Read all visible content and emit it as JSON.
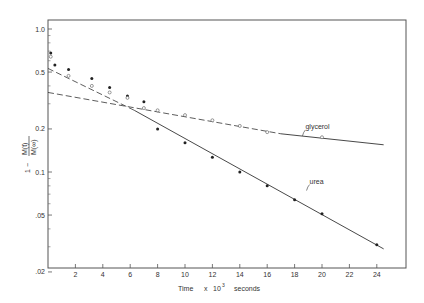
{
  "chart_data": {
    "type": "line",
    "title": "",
    "xlabel": "Time x 10^3 seconds",
    "xlabel_parts": {
      "main": "Time",
      "mult": "x",
      "base": "10",
      "exp": "3",
      "unit": "seconds"
    },
    "ylabel": "1 - M(t)/M(∞)",
    "ylabel_parts": {
      "prefix": "1 −",
      "num": "M(t)",
      "den": "M(∞)"
    },
    "xlim": [
      0,
      26
    ],
    "ylim": [
      0.02,
      1.1
    ],
    "yscale": "log",
    "grid": false,
    "x_ticks": [
      2,
      4,
      6,
      8,
      10,
      12,
      14,
      16,
      18,
      20,
      22,
      24
    ],
    "x_tick_labels": [
      "2",
      "4",
      "6",
      "8",
      "10",
      "12",
      "14",
      "16",
      "18",
      "20",
      "22",
      "24"
    ],
    "y_ticks": [
      1.0,
      0.5,
      0.2,
      0.1,
      0.05,
      0.02
    ],
    "y_tick_labels": [
      "1.0",
      "0.5",
      "0.2",
      "0.1",
      ".05",
      ".02"
    ],
    "series": [
      {
        "name": "urea",
        "marker": "filled",
        "points": [
          [
            0.2,
            0.68
          ],
          [
            0.5,
            0.56
          ],
          [
            1.5,
            0.52
          ],
          [
            3.2,
            0.45
          ],
          [
            4.5,
            0.39
          ],
          [
            5.8,
            0.34
          ],
          [
            7.0,
            0.31
          ],
          [
            8,
            0.2
          ],
          [
            10,
            0.16
          ],
          [
            12,
            0.127
          ],
          [
            14,
            0.1
          ],
          [
            16,
            0.08
          ],
          [
            18,
            0.064
          ],
          [
            20,
            0.051
          ],
          [
            24,
            0.031
          ]
        ],
        "fit_solid": [
          [
            6.3,
            0.27
          ],
          [
            24.5,
            0.029
          ]
        ],
        "fit_dashed": [
          [
            0,
            0.53
          ],
          [
            6.3,
            0.27
          ]
        ]
      },
      {
        "name": "glycerol",
        "marker": "open",
        "points": [
          [
            0.2,
            0.64
          ],
          [
            1.5,
            0.47
          ],
          [
            3.2,
            0.4
          ],
          [
            4.5,
            0.36
          ],
          [
            5.8,
            0.33
          ],
          [
            7.0,
            0.28
          ],
          [
            8,
            0.27
          ],
          [
            10,
            0.25
          ],
          [
            12,
            0.23
          ],
          [
            14,
            0.21
          ],
          [
            16,
            0.19
          ],
          [
            20,
            0.175
          ]
        ],
        "fit_dashed": [
          [
            0,
            0.36
          ],
          [
            17,
            0.185
          ]
        ],
        "fit_solid": [
          [
            17,
            0.185
          ],
          [
            24.5,
            0.155
          ]
        ]
      }
    ],
    "annotations": [
      {
        "text": "glycerol",
        "x": 18.5,
        "y": 0.2
      },
      {
        "text": "urea",
        "x": 18.8,
        "y": 0.083
      }
    ]
  }
}
